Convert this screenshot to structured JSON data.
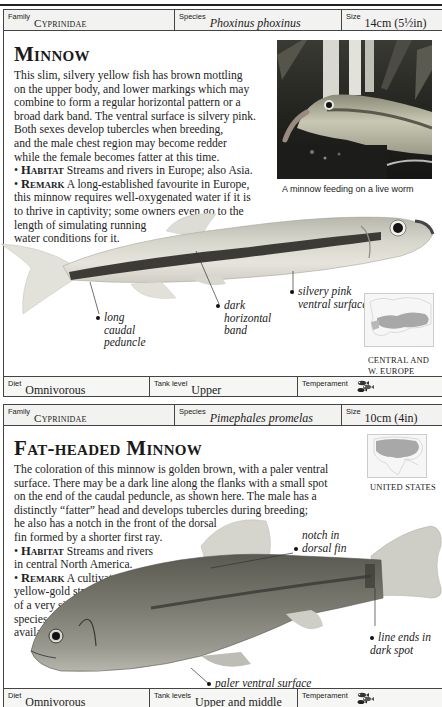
{
  "entries": [
    {
      "header": {
        "family_label": "Family",
        "family_value": "Cyprinidae",
        "species_label": "Species",
        "species_value": "Phoxinus phoxinus",
        "size_label": "Size",
        "size_value": "14cm (5½in)"
      },
      "title": "Minnow",
      "description": [
        "This slim, silvery yellow fish has brown mottling",
        "on the upper body, and lower markings which may",
        "combine to form a regular horizontal pattern or a",
        "broad dark band. The ventral surface is silvery pink.",
        "Both sexes develop tubercles when breeding,",
        "and the male chest region may become redder",
        "while the female becomes fatter at this time."
      ],
      "habitat_label": "Habitat",
      "habitat_text": "Streams and rivers in Europe; also Asia.",
      "remark_label": "Remark",
      "remark_lines": [
        "A long-established favourite in Europe,",
        "this minnow requires well-oxygenated water if it is",
        "to thrive in captivity; some owners even go to the",
        "length of simulating running",
        "water conditions for it."
      ],
      "photo_caption": "A minnow feeding on a live worm",
      "annotations": {
        "tail": [
          "long",
          "caudal",
          "peduncle"
        ],
        "band": [
          "dark",
          "horizontal",
          "band"
        ],
        "ventral": [
          "silvery pink",
          "ventral surface"
        ]
      },
      "range_label": [
        "CENTRAL AND",
        "W. EUROPE"
      ],
      "footer": {
        "diet_label": "Diet",
        "diet_value": "Omnivorous",
        "tank_label": "Tank level",
        "tank_value": "Upper",
        "temperament_label": "Temperament",
        "temperament_icon": "fish-group-icon"
      }
    },
    {
      "header": {
        "family_label": "Family",
        "family_value": "Cyprinidae",
        "species_label": "Species",
        "species_value": "Pimephales promelas",
        "size_label": "Size",
        "size_value": "10cm (4in)"
      },
      "title": "Fat-headed Minnow",
      "description": [
        "The coloration of this minnow is golden brown, with a paler ventral",
        "surface. There may be a dark line along the flanks with a small spot",
        "on the end of the caudal peduncle, as shown here. The male has a",
        "distinctly “fatter” head and develops tubercles during breeding;",
        "he also has a notch in the front of the dorsal",
        "fin formed by a shorter first ray."
      ],
      "habitat_label": "Habitat",
      "habitat_lines": [
        "Streams and rivers",
        "in central North America."
      ],
      "remark_label": "Remark",
      "remark_lines": [
        "A cultivated",
        "yellow-gold strain",
        "of a very similar",
        "species is",
        "available."
      ],
      "annotations": {
        "notch": [
          "notch in",
          "dorsal fin"
        ],
        "spot": [
          "line ends in",
          "dark spot"
        ],
        "ventral": [
          "paler ventral surface"
        ]
      },
      "range_label": [
        "UNITED STATES"
      ],
      "footer": {
        "diet_label": "Diet",
        "diet_value": "Omnivorous",
        "tank_label": "Tank levels",
        "tank_value": "Upper and middle",
        "temperament_label": "Temperament",
        "temperament_icon": "fish-group-icon"
      }
    }
  ]
}
